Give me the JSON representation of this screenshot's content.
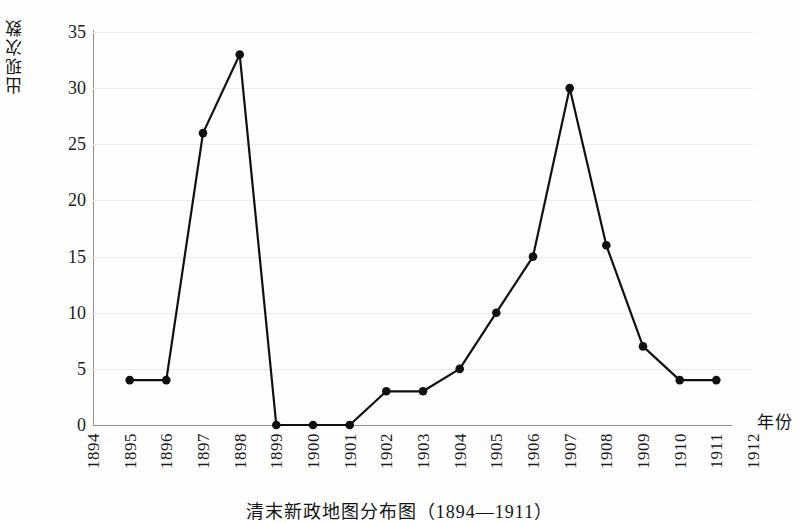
{
  "chart_data": {
    "type": "line",
    "title": "",
    "caption": "清末新政地图分布图（1894—1911）",
    "xlabel": "年份",
    "ylabel": "出现次数",
    "grid": true,
    "legend": "none",
    "xlim": [
      1894,
      1912
    ],
    "ylim": [
      0,
      35
    ],
    "ytick_labels": [
      "0",
      "5",
      "10",
      "15",
      "20",
      "25",
      "30",
      "35"
    ],
    "ytick_values": [
      0,
      5,
      10,
      15,
      20,
      25,
      30,
      35
    ],
    "xtick_labels": [
      "1894",
      "1895",
      "1896",
      "1897",
      "1898",
      "1899",
      "1900",
      "1901",
      "1902",
      "1903",
      "1904",
      "1905",
      "1906",
      "1907",
      "1908",
      "1909",
      "1910",
      "1911",
      "1912"
    ],
    "x": [
      1895,
      1896,
      1897,
      1898,
      1899,
      1900,
      1901,
      1902,
      1903,
      1904,
      1905,
      1906,
      1907,
      1908,
      1909,
      1910,
      1911
    ],
    "values": [
      4,
      4,
      26,
      33,
      0,
      0,
      0,
      3,
      3,
      5,
      10,
      15,
      30,
      16,
      7,
      4,
      4
    ],
    "series": [
      {
        "name": "出现次数",
        "values": [
          4,
          4,
          26,
          33,
          0,
          0,
          0,
          3,
          3,
          5,
          10,
          15,
          30,
          16,
          7,
          4,
          4
        ]
      }
    ],
    "line_color": "#101010",
    "marker_color": "#101010",
    "grid_color": "#eceaef",
    "axis_color": "#8d8d92"
  }
}
